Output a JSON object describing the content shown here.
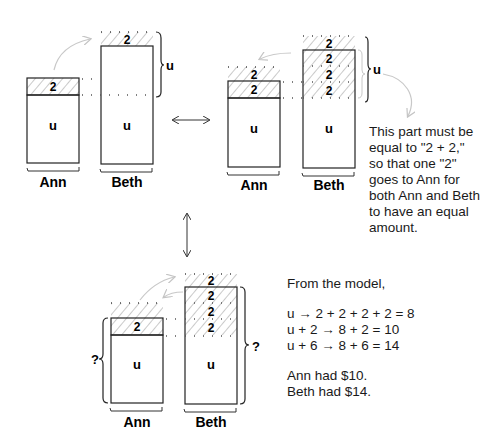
{
  "diagram": {
    "unit_label": "u",
    "block_label": "2",
    "unknown_label": "?",
    "panels": [
      {
        "id": "panel-1",
        "ann": {
          "name": "Ann",
          "blocks": [
            "2"
          ],
          "unit": "u"
        },
        "beth": {
          "name": "Beth",
          "blocks_dotted": [
            "2"
          ],
          "unit": "u"
        },
        "brace_label": "u"
      },
      {
        "id": "panel-2",
        "ann": {
          "name": "Ann",
          "blocks": [
            "2",
            "2"
          ],
          "unit": "u"
        },
        "beth": {
          "name": "Beth",
          "blocks": [
            "2",
            "2",
            "2",
            "2"
          ],
          "unit": "u"
        },
        "brace_label": "u"
      },
      {
        "id": "panel-3",
        "ann": {
          "name": "Ann",
          "blocks": [
            "2"
          ],
          "unit": "u"
        },
        "beth": {
          "name": "Beth",
          "blocks": [
            "2",
            "2",
            "2",
            "2"
          ],
          "unit": "u"
        },
        "brace_label_ann": "?",
        "brace_label_beth": "?"
      }
    ],
    "note": "This part must be equal to \"2 + 2,\" so that one \"2\" goes to Ann for both Ann and Beth to have an equal amount.",
    "solution": {
      "intro": "From the model,",
      "steps": [
        "u → 2 + 2 + 2 + 2 = 8",
        "u + 2 → 8 + 2 = 10",
        "u + 6 → 8 + 6 = 14"
      ],
      "answers": [
        "Ann had $10.",
        "Beth had $14."
      ]
    },
    "colors": {
      "stroke": "#222222",
      "hatch": "#b8b8b8",
      "arrow_light": "#c4c4c4"
    }
  }
}
